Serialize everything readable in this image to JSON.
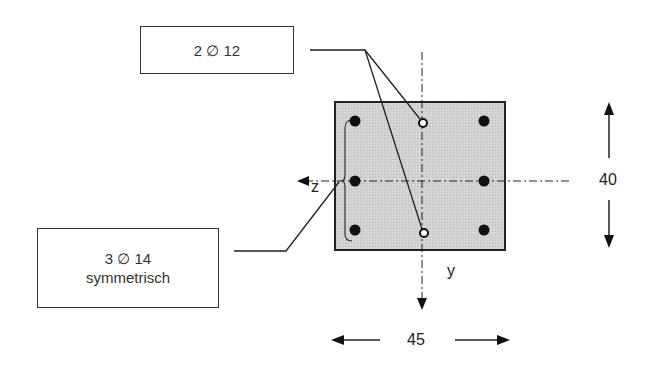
{
  "diagram": {
    "type": "reinforced concrete cross-section",
    "labels": {
      "top_bars": "2 ∅ 12",
      "side_bars_line1": "3 ∅ 14",
      "side_bars_line2": "symmetrisch"
    },
    "axes": {
      "z": "z",
      "y": "y"
    },
    "dimensions": {
      "height": "40",
      "width": "45"
    },
    "colors": {
      "section_fill": "#cfcfcf",
      "outline": "#222222",
      "bar_fill": "#111111",
      "open_bar_fill": "#ffffff"
    },
    "bars": {
      "solid": [
        [
          355,
          121
        ],
        [
          484,
          121
        ],
        [
          355,
          181
        ],
        [
          484,
          181
        ],
        [
          355,
          230
        ],
        [
          484,
          230
        ]
      ],
      "open": [
        [
          423,
          123
        ],
        [
          424,
          233
        ]
      ]
    }
  }
}
